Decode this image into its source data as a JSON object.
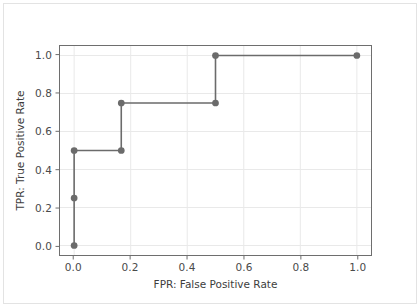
{
  "chart_data": {
    "type": "line",
    "title": "",
    "xlabel": "FPR: False Positive Rate",
    "ylabel": "TPR: True Positive Rate",
    "xlim": [
      -0.05,
      1.05
    ],
    "ylim": [
      -0.05,
      1.05
    ],
    "grid": true,
    "legend": null,
    "drawstyle": "steps-post",
    "marker": "circle",
    "line_color": "#6b6b6b",
    "marker_color": "#6b6b6b",
    "grid_color": "#e9e9e9",
    "axis_color": "#6e6e6e",
    "xticks": [
      0.0,
      0.2,
      0.4,
      0.6,
      0.8,
      1.0
    ],
    "xtick_labels": [
      "0.0",
      "0.2",
      "0.4",
      "0.6",
      "0.8",
      "1.0"
    ],
    "yticks": [
      0.0,
      0.2,
      0.4,
      0.6,
      0.8,
      1.0
    ],
    "ytick_labels": [
      "0.0",
      "0.2",
      "0.4",
      "0.6",
      "0.8",
      "1.0"
    ],
    "series": [
      {
        "name": "ROC curve",
        "x": [
          0.0,
          0.0,
          0.0,
          0.1667,
          0.1667,
          0.5,
          0.5,
          1.0
        ],
        "y": [
          0.0,
          0.25,
          0.5,
          0.5,
          0.75,
          0.75,
          1.0,
          1.0
        ]
      }
    ],
    "markers": [
      {
        "x": 0.0,
        "y": 0.0
      },
      {
        "x": 0.0,
        "y": 0.25
      },
      {
        "x": 0.0,
        "y": 0.5
      },
      {
        "x": 0.1667,
        "y": 0.5
      },
      {
        "x": 0.1667,
        "y": 0.75
      },
      {
        "x": 0.5,
        "y": 0.75
      },
      {
        "x": 0.5,
        "y": 1.0
      },
      {
        "x": 1.0,
        "y": 1.0
      }
    ]
  }
}
